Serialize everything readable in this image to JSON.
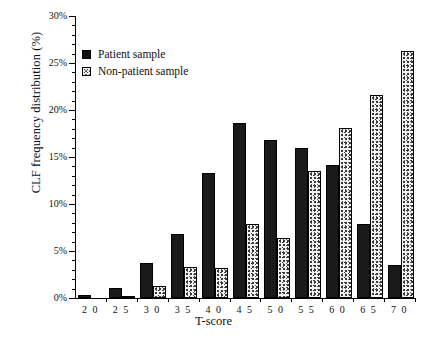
{
  "chart_data": {
    "type": "bar",
    "title": "",
    "xlabel": "T-score",
    "ylabel": "CLF frequency distribution (%)",
    "categories": [
      "20",
      "25",
      "30",
      "35",
      "40",
      "45",
      "50",
      "55",
      "60",
      "65",
      "70"
    ],
    "series": [
      {
        "name": "Patient sample",
        "key": "patient",
        "values": [
          0.3,
          1.1,
          3.7,
          6.8,
          13.3,
          18.6,
          16.8,
          16.0,
          14.1,
          7.9,
          3.5
        ]
      },
      {
        "name": "Non-patient sample",
        "key": "nonpatient",
        "values": [
          0.0,
          0.2,
          1.3,
          3.3,
          3.2,
          7.9,
          6.4,
          13.5,
          18.1,
          21.6,
          26.3
        ]
      }
    ],
    "ylim": [
      0,
      30
    ],
    "ytick_labels": [
      "0%",
      "5%",
      "10%",
      "15%",
      "20%",
      "25%",
      "30%"
    ],
    "ytick_values": [
      0,
      5,
      10,
      15,
      20,
      25,
      30
    ],
    "yminor_step": 1,
    "xtick_labels": [
      "2 0",
      "2 5",
      "3 0",
      "3 5",
      "4 0",
      "4 5",
      "5 0",
      "5 5",
      "6 0",
      "6 5",
      "7 0"
    ],
    "grid": false,
    "legend_position": "upper-left",
    "colors": {
      "patient": "#1a1a1a",
      "nonpatient": "#f3f3f3",
      "axis": "#000000"
    }
  },
  "legend": {
    "items": [
      {
        "label": "Patient sample",
        "swatch": "solid-black-swatch"
      },
      {
        "label": "Non-patient sample",
        "swatch": "stippled-swatch"
      }
    ]
  }
}
